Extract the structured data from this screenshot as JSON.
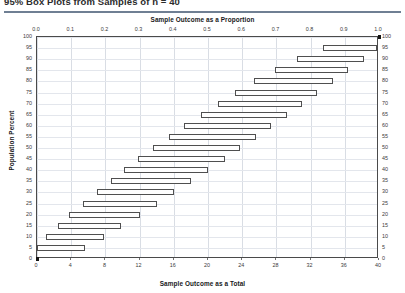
{
  "header": {
    "title": "95% Box Plots from Samples of n = 40",
    "title_clipped": true
  },
  "axes": {
    "top_title": "Sample Outcome as a Proportion",
    "bottom_title": "Sample Outcome as a  Total",
    "left_title": "Population Percent",
    "right_title": "Population Percent"
  },
  "chart_data": {
    "type": "bar",
    "orientation": "horizontal",
    "title": "95% Box Plots from Samples of n = 40",
    "xlabel": "Sample Outcome as a Total",
    "ylabel": "Population Percent",
    "x2label": "Sample Outcome as a Proportion",
    "xlim": [
      0,
      40
    ],
    "ylim": [
      0,
      100
    ],
    "xticks": [
      0,
      4,
      8,
      12,
      16,
      20,
      24,
      28,
      32,
      36,
      40
    ],
    "xticklabels": [
      "0",
      "4",
      "8",
      "12",
      "16",
      "20",
      "24",
      "28",
      "32",
      "36",
      "40"
    ],
    "x2ticks": [
      0.0,
      0.1,
      0.2,
      0.3,
      0.4,
      0.5,
      0.6,
      0.7,
      0.8,
      0.9,
      1.0
    ],
    "x2ticklabels": [
      "0.0",
      "0.1",
      "0.2",
      "0.3",
      "0.4",
      "0.5",
      "0.6",
      "0.7",
      "0.8",
      "0.9",
      "1.0"
    ],
    "yticks": [
      0,
      5,
      10,
      15,
      20,
      25,
      30,
      35,
      40,
      45,
      50,
      55,
      60,
      65,
      70,
      75,
      80,
      85,
      90,
      95,
      100
    ],
    "yticklabels": [
      "0",
      "5",
      "10",
      "15",
      "20",
      "25",
      "30",
      "35",
      "40",
      "45",
      "50",
      "55",
      "60",
      "65",
      "70",
      "75",
      "80",
      "85",
      "90",
      "95",
      "100"
    ],
    "grid": true,
    "legend": "none",
    "sample_size": 40,
    "confidence_level": "95%",
    "series_name": "95% confidence interval of sample outcome",
    "boxes": [
      {
        "population_percent": 0,
        "low": 0.0,
        "high": 0.0,
        "marker": "square"
      },
      {
        "population_percent": 5,
        "low": 0.0,
        "high": 5.6
      },
      {
        "population_percent": 10,
        "low": 1.0,
        "high": 7.8
      },
      {
        "population_percent": 15,
        "low": 2.4,
        "high": 9.8
      },
      {
        "population_percent": 20,
        "low": 3.8,
        "high": 12.0
      },
      {
        "population_percent": 25,
        "low": 5.4,
        "high": 14.0
      },
      {
        "population_percent": 30,
        "low": 7.0,
        "high": 16.0
      },
      {
        "population_percent": 35,
        "low": 8.6,
        "high": 18.0
      },
      {
        "population_percent": 40,
        "low": 10.2,
        "high": 20.0
      },
      {
        "population_percent": 45,
        "low": 11.8,
        "high": 22.0
      },
      {
        "population_percent": 50,
        "low": 13.6,
        "high": 23.8
      },
      {
        "population_percent": 55,
        "low": 15.4,
        "high": 25.6
      },
      {
        "population_percent": 60,
        "low": 17.2,
        "high": 27.4
      },
      {
        "population_percent": 65,
        "low": 19.2,
        "high": 29.2
      },
      {
        "population_percent": 70,
        "low": 21.2,
        "high": 31.0
      },
      {
        "population_percent": 75,
        "low": 23.2,
        "high": 32.8
      },
      {
        "population_percent": 80,
        "low": 25.4,
        "high": 34.6
      },
      {
        "population_percent": 85,
        "low": 27.8,
        "high": 36.4
      },
      {
        "population_percent": 90,
        "low": 30.4,
        "high": 38.2
      },
      {
        "population_percent": 95,
        "low": 33.4,
        "high": 39.8
      },
      {
        "population_percent": 100,
        "low": 40.0,
        "high": 40.0,
        "marker": "square"
      }
    ]
  },
  "colors": {
    "box_stroke": "#4f4f4f",
    "box_fill": "#fefefe",
    "grid": "#d9dde4",
    "frame": "#4a4a4a",
    "rule": "#6f7f93",
    "text": "#1a1a1a"
  }
}
